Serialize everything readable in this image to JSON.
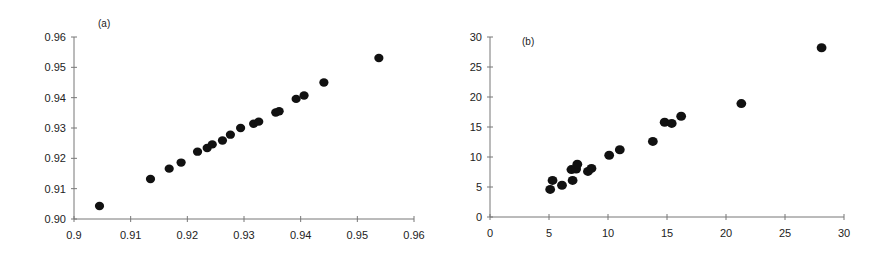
{
  "chart_data": [
    {
      "type": "scatter",
      "panel_label": "(a)",
      "title": "",
      "xlabel": "",
      "ylabel": "",
      "xlim": [
        0.9,
        0.96
      ],
      "ylim": [
        0.9,
        0.96
      ],
      "x_ticks": [
        "0.9",
        "0.91",
        "0.92",
        "0.93",
        "0.94",
        "0.95",
        "0.96"
      ],
      "y_ticks": [
        "0.90",
        "0.91",
        "0.92",
        "0.93",
        "0.94",
        "0.95",
        "0.96"
      ],
      "grid": false,
      "legend": null,
      "marker_color": "#111111",
      "points": [
        {
          "x": 0.9045,
          "y": 0.9043
        },
        {
          "x": 0.9135,
          "y": 0.9132
        },
        {
          "x": 0.9168,
          "y": 0.9166
        },
        {
          "x": 0.9189,
          "y": 0.9186
        },
        {
          "x": 0.9218,
          "y": 0.9222
        },
        {
          "x": 0.9235,
          "y": 0.9234
        },
        {
          "x": 0.9244,
          "y": 0.9246
        },
        {
          "x": 0.9262,
          "y": 0.9259
        },
        {
          "x": 0.9276,
          "y": 0.9278
        },
        {
          "x": 0.9294,
          "y": 0.93
        },
        {
          "x": 0.9317,
          "y": 0.9314
        },
        {
          "x": 0.9326,
          "y": 0.9321
        },
        {
          "x": 0.9356,
          "y": 0.9351
        },
        {
          "x": 0.9362,
          "y": 0.9355
        },
        {
          "x": 0.9392,
          "y": 0.9396
        },
        {
          "x": 0.9406,
          "y": 0.9407
        },
        {
          "x": 0.9441,
          "y": 0.945
        },
        {
          "x": 0.9538,
          "y": 0.9531
        }
      ]
    },
    {
      "type": "scatter",
      "panel_label": "(b)",
      "title": "",
      "xlabel": "",
      "ylabel": "",
      "xlim": [
        0,
        30
      ],
      "ylim": [
        0,
        30
      ],
      "x_ticks": [
        "0",
        "5",
        "10",
        "15",
        "20",
        "25",
        "30"
      ],
      "y_ticks": [
        "0",
        "5",
        "10",
        "15",
        "20",
        "25",
        "30"
      ],
      "grid": false,
      "legend": null,
      "marker_color": "#111111",
      "points": [
        {
          "x": 5.1,
          "y": 4.6
        },
        {
          "x": 5.3,
          "y": 6.1
        },
        {
          "x": 6.1,
          "y": 5.3
        },
        {
          "x": 6.9,
          "y": 7.9
        },
        {
          "x": 7.0,
          "y": 6.1
        },
        {
          "x": 7.3,
          "y": 8.0
        },
        {
          "x": 7.4,
          "y": 8.8
        },
        {
          "x": 8.3,
          "y": 7.6
        },
        {
          "x": 8.6,
          "y": 8.1
        },
        {
          "x": 10.1,
          "y": 10.3
        },
        {
          "x": 11.0,
          "y": 11.2
        },
        {
          "x": 13.8,
          "y": 12.6
        },
        {
          "x": 14.8,
          "y": 15.8
        },
        {
          "x": 15.4,
          "y": 15.6
        },
        {
          "x": 16.2,
          "y": 16.8
        },
        {
          "x": 21.3,
          "y": 18.9
        },
        {
          "x": 28.1,
          "y": 28.2
        }
      ]
    }
  ]
}
